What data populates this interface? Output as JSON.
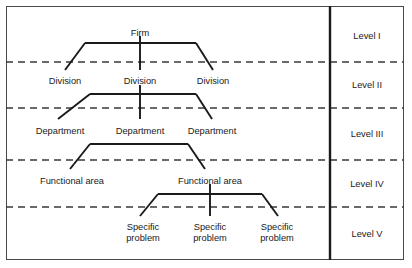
{
  "diagram": {
    "frame": {
      "x": 6,
      "y": 6,
      "width": 398,
      "height": 254
    },
    "divider_x": 330,
    "border_color": "#4a4a4a",
    "line_color": "#1a1a1a",
    "dash_color": "#3a3a3a",
    "background": "#ffffff"
  },
  "levels": [
    {
      "label": "Level I",
      "y": 36,
      "separator_y": 62
    },
    {
      "label": "Level II",
      "y": 85,
      "separator_y": 108
    },
    {
      "label": "Level III",
      "y": 134,
      "separator_y": 160
    },
    {
      "label": "Level IV",
      "y": 184,
      "separator_y": 207
    },
    {
      "label": "Level V",
      "y": 234,
      "separator_y": null
    }
  ],
  "nodes": [
    {
      "id": "firm",
      "label": "Firm",
      "x": 140,
      "y": 28,
      "level": 1,
      "lines": 1
    },
    {
      "id": "div1",
      "label": "Division",
      "x": 65,
      "y": 76,
      "level": 2,
      "lines": 1
    },
    {
      "id": "div2",
      "label": "Division",
      "x": 140,
      "y": 76,
      "level": 2,
      "lines": 1
    },
    {
      "id": "div3",
      "label": "Division",
      "x": 213,
      "y": 76,
      "level": 2,
      "lines": 1
    },
    {
      "id": "dept1",
      "label": "Department",
      "x": 60,
      "y": 126,
      "level": 3,
      "lines": 1
    },
    {
      "id": "dept2",
      "label": "Department",
      "x": 140,
      "y": 126,
      "level": 3,
      "lines": 1
    },
    {
      "id": "dept3",
      "label": "Department",
      "x": 212,
      "y": 126,
      "level": 3,
      "lines": 1
    },
    {
      "id": "func1",
      "label": "Functional area",
      "x": 72,
      "y": 176,
      "level": 4,
      "lines": 1
    },
    {
      "id": "func2",
      "label": "Functional area",
      "x": 210,
      "y": 176,
      "level": 4,
      "lines": 1
    },
    {
      "id": "prob1",
      "label": "Specific problem",
      "x": 143,
      "y": 222,
      "level": 5,
      "lines": 2
    },
    {
      "id": "prob2",
      "label": "Specific problem",
      "x": 210,
      "y": 222,
      "level": 5,
      "lines": 2
    },
    {
      "id": "prob3",
      "label": "Specific problem",
      "x": 277,
      "y": 222,
      "level": 5,
      "lines": 2
    }
  ],
  "brackets": [
    {
      "id": "firm-to-divisions",
      "parent": "firm",
      "bar_y": 43,
      "bar_left": 85,
      "bar_right": 196,
      "stem_x": 140,
      "stem_top": 36,
      "has_stem": true,
      "legs": [
        {
          "x": 65,
          "y": 70
        },
        {
          "x": 213,
          "y": 70
        }
      ],
      "center_drop": {
        "x": 140,
        "y": 70
      }
    },
    {
      "id": "division-to-departments",
      "parent": "div2",
      "bar_y": 94,
      "bar_left": 90,
      "bar_right": 196,
      "stem_x": 140,
      "stem_top": 85,
      "has_stem": true,
      "legs": [
        {
          "x": 58,
          "y": 119
        },
        {
          "x": 212,
          "y": 119
        }
      ],
      "center_drop": {
        "x": 140,
        "y": 119
      }
    },
    {
      "id": "department-to-functional",
      "parent": "dept2",
      "bar_y": 144,
      "bar_left": 90,
      "bar_right": 188,
      "stem_x": 140,
      "stem_top": 134,
      "has_stem": false,
      "legs": [
        {
          "x": 70,
          "y": 169
        },
        {
          "x": 205,
          "y": 169
        }
      ],
      "center_drop": null
    },
    {
      "id": "functional-to-problems",
      "parent": "func2",
      "bar_y": 194,
      "bar_left": 158,
      "bar_right": 262,
      "stem_x": 210,
      "stem_top": 184,
      "has_stem": true,
      "legs": [
        {
          "x": 140,
          "y": 216
        },
        {
          "x": 278,
          "y": 216
        }
      ],
      "center_drop": {
        "x": 210,
        "y": 216
      }
    }
  ]
}
